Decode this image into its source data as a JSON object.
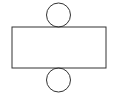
{
  "diagram": {
    "stroke_color": "#333333",
    "background": "#ffffff",
    "shapes": {
      "top_circle": {
        "cx": 58.5,
        "cy": 15,
        "r": 12
      },
      "rectangle": {
        "x": 12,
        "y": 27,
        "width": 94,
        "height": 41
      },
      "bottom_circle": {
        "cx": 58.5,
        "cy": 80,
        "r": 12
      }
    }
  }
}
